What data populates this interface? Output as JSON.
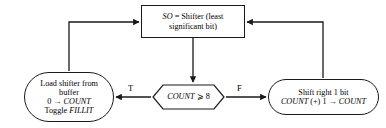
{
  "diagram": {
    "background_color": "#ffffff",
    "stroke_color": "#1a1a1a",
    "nodes": {
      "shifter": {
        "shape": "rectangle",
        "line1_italic": "SO",
        "line1_rest": " = Shifter (least",
        "line2": "significant bit)"
      },
      "load": {
        "shape": "rounded",
        "line1": "Load shifter from",
        "line2": "buffer",
        "line3": "0 → COUNT",
        "line3_plain": "0 → ",
        "line3_italic": "COUNT",
        "line4_plain": "Toggle ",
        "line4_italic": "FILLIT"
      },
      "decision": {
        "shape": "hexagon",
        "text_italic": "COUNT",
        "text_rest": " ⩾ 8"
      },
      "shift": {
        "shape": "rounded",
        "line1": "Shift right 1 bit",
        "line2_italic_a": "COUNT",
        "line2_mid": " (+) 1 → ",
        "line2_italic_b": "COUNT"
      }
    },
    "edge_labels": {
      "true": "T",
      "false": "F"
    }
  }
}
